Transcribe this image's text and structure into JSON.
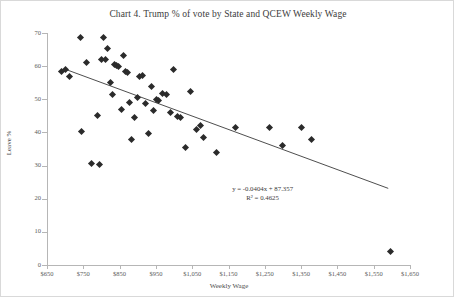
{
  "chart_data": {
    "type": "scatter",
    "title": "Chart 4. Trump % of vote by State and QCEW Weekly Wage",
    "xlabel": "Weekly Wage",
    "ylabel": "Leave %",
    "xlim": [
      650,
      1650
    ],
    "ylim": [
      0,
      70
    ],
    "xticks": [
      650,
      750,
      850,
      950,
      1050,
      1150,
      1250,
      1350,
      1450,
      1550,
      1650
    ],
    "xtick_labels": [
      "$650",
      "$750",
      "$850",
      "$950",
      "$1,050",
      "$1,150",
      "$1,250",
      "$1,350",
      "$1,450",
      "$1,550",
      "$1,650"
    ],
    "yticks": [
      0,
      10,
      20,
      30,
      40,
      50,
      60,
      70
    ],
    "ytick_labels": [
      "0",
      "10",
      "20",
      "30",
      "40",
      "50",
      "60",
      "70"
    ],
    "grid": false,
    "legend": false,
    "marker_shape": "diamond",
    "marker_color": "#2b2b2b",
    "trendline": {
      "type": "linear",
      "slope": -0.0404,
      "intercept": 87.357,
      "r_squared": 0.4625,
      "equation_label": "y = -0.0404x + 87.357",
      "r2_label": "R² = 0.4625",
      "x_start": 705,
      "x_end": 1590,
      "color": "#3a3a3a"
    },
    "points": [
      {
        "x": 690,
        "y": 58.3
      },
      {
        "x": 700,
        "y": 59.0
      },
      {
        "x": 712,
        "y": 56.8
      },
      {
        "x": 742,
        "y": 68.5
      },
      {
        "x": 745,
        "y": 40.3
      },
      {
        "x": 760,
        "y": 61.2
      },
      {
        "x": 772,
        "y": 30.6
      },
      {
        "x": 788,
        "y": 45.0
      },
      {
        "x": 795,
        "y": 30.3
      },
      {
        "x": 800,
        "y": 62.0
      },
      {
        "x": 806,
        "y": 68.7
      },
      {
        "x": 812,
        "y": 62.0
      },
      {
        "x": 818,
        "y": 65.3
      },
      {
        "x": 824,
        "y": 55.0
      },
      {
        "x": 830,
        "y": 51.5
      },
      {
        "x": 836,
        "y": 60.5
      },
      {
        "x": 842,
        "y": 60.2
      },
      {
        "x": 848,
        "y": 59.8
      },
      {
        "x": 854,
        "y": 47.0
      },
      {
        "x": 860,
        "y": 63.2
      },
      {
        "x": 866,
        "y": 58.5
      },
      {
        "x": 872,
        "y": 58.2
      },
      {
        "x": 878,
        "y": 49.0
      },
      {
        "x": 884,
        "y": 38.0
      },
      {
        "x": 890,
        "y": 44.5
      },
      {
        "x": 900,
        "y": 50.5
      },
      {
        "x": 906,
        "y": 57.0
      },
      {
        "x": 912,
        "y": 57.2
      },
      {
        "x": 920,
        "y": 48.8
      },
      {
        "x": 930,
        "y": 39.6
      },
      {
        "x": 938,
        "y": 54.0
      },
      {
        "x": 944,
        "y": 46.5
      },
      {
        "x": 952,
        "y": 50.0
      },
      {
        "x": 958,
        "y": 49.5
      },
      {
        "x": 968,
        "y": 51.8
      },
      {
        "x": 978,
        "y": 51.5
      },
      {
        "x": 990,
        "y": 46.0
      },
      {
        "x": 998,
        "y": 59.0
      },
      {
        "x": 1010,
        "y": 44.8
      },
      {
        "x": 1018,
        "y": 44.5
      },
      {
        "x": 1032,
        "y": 35.4
      },
      {
        "x": 1046,
        "y": 52.5
      },
      {
        "x": 1062,
        "y": 40.8
      },
      {
        "x": 1072,
        "y": 42.0
      },
      {
        "x": 1082,
        "y": 38.4
      },
      {
        "x": 1118,
        "y": 34.0
      },
      {
        "x": 1168,
        "y": 41.6
      },
      {
        "x": 1262,
        "y": 41.5
      },
      {
        "x": 1300,
        "y": 36.2
      },
      {
        "x": 1352,
        "y": 41.6
      },
      {
        "x": 1378,
        "y": 38.0
      },
      {
        "x": 1596,
        "y": 4.2
      }
    ]
  }
}
